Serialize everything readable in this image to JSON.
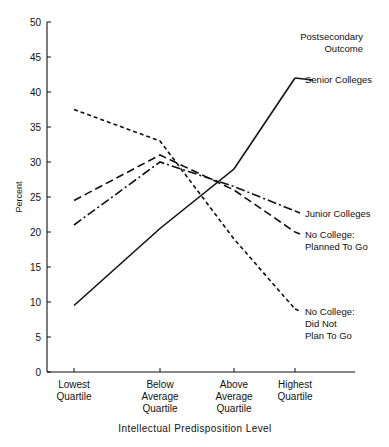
{
  "chart_data": {
    "type": "line",
    "title": "",
    "xlabel": "Intellectual Predisposition Level",
    "ylabel": "Percent",
    "ylim": [
      0,
      50
    ],
    "ytick_values": [
      0,
      5,
      10,
      15,
      20,
      25,
      30,
      35,
      40,
      45,
      50
    ],
    "ytick_labels": [
      "0",
      "5",
      "10",
      "15",
      "20",
      "25",
      "30",
      "35",
      "40",
      "45",
      "50"
    ],
    "grid": false,
    "legend_position": "right-inline",
    "legend_title": "Postsecondary\nOutcome",
    "legend_title_line1": "Postsecondary",
    "legend_title_line2": "Outcome",
    "categories": [
      "Lowest Quartile",
      "Below Average Quartile",
      "Above Average Quartile",
      "Highest Quartile"
    ],
    "category_lines": [
      [
        "Lowest",
        "Quartile"
      ],
      [
        "Below",
        "Average",
        "Quartile"
      ],
      [
        "Above",
        "Average",
        "Quartile"
      ],
      [
        "Highest",
        "Quartile"
      ]
    ],
    "series": [
      {
        "name": "Senior Colleges",
        "label_lines": [
          "Senior Colleges"
        ],
        "style": "solid",
        "values": [
          9.5,
          20.5,
          29.0,
          42.0
        ]
      },
      {
        "name": "Junior Colleges",
        "label_lines": [
          "Junior Colleges"
        ],
        "style": "dash-dot",
        "values": [
          21.0,
          30.0,
          26.5,
          23.0
        ]
      },
      {
        "name": "No College: Planned To Go",
        "label_lines": [
          "No College:",
          "Planned To Go"
        ],
        "style": "dashed",
        "values": [
          24.5,
          31.0,
          26.0,
          20.0
        ]
      },
      {
        "name": "No College: Did Not Plan To Go",
        "label_lines": [
          "No College:",
          "Did Not",
          "Plan To Go"
        ],
        "style": "dotted",
        "values": [
          37.5,
          33.0,
          19.0,
          9.0
        ]
      }
    ]
  }
}
